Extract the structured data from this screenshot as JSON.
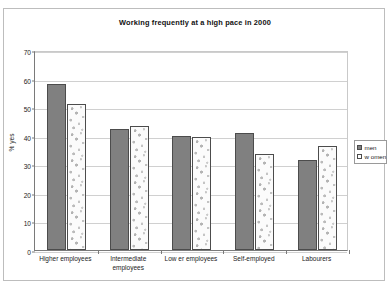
{
  "chart_data": {
    "type": "bar",
    "title": "Working frequently at a high pace in 2000",
    "xlabel": "",
    "ylabel": "% yes",
    "ylim": [
      0,
      70
    ],
    "ytick_step": 10,
    "yticks": [
      0,
      10,
      20,
      30,
      40,
      50,
      60,
      70
    ],
    "ytick_labels": [
      "0",
      "10",
      "20",
      "30",
      "40",
      "50",
      "60",
      "70"
    ],
    "grid": true,
    "legend_position": "right",
    "categories": [
      "Higher employees",
      "Intermediate employees",
      "Low er employees",
      "Self-employed",
      "Labourers"
    ],
    "category_lines": [
      [
        "Higher employees"
      ],
      [
        "Intermediate",
        "employees"
      ],
      [
        "Low er employees"
      ],
      [
        "Self-employed"
      ],
      [
        "Labourers"
      ]
    ],
    "series": [
      {
        "name": "men",
        "color": "#808080",
        "values": [
          58,
          42.5,
          40,
          41,
          31.5
        ]
      },
      {
        "name": "w omen",
        "color": "#fbfbfb",
        "values": [
          51,
          43.5,
          39.5,
          33.5,
          36.5
        ]
      }
    ]
  },
  "legend": {
    "items": [
      {
        "label": "men"
      },
      {
        "label": "w omen"
      }
    ]
  }
}
